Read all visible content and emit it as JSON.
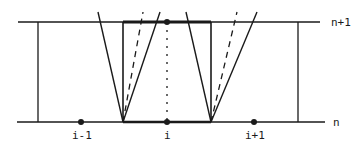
{
  "diagram": {
    "colors": {
      "ink": "#1a1a1a",
      "background": "#ffffff"
    },
    "time_levels": {
      "upper": {
        "label": "n+1",
        "y": 22
      },
      "lower": {
        "label": "n",
        "y": 122
      }
    },
    "grid_points": [
      {
        "label": "i-1",
        "x": 81
      },
      {
        "label": "i",
        "x": 167
      },
      {
        "label": "i+1",
        "x": 254
      }
    ],
    "cell": {
      "left_x": 123,
      "right_x": 211
    },
    "outer_boundaries": {
      "left_x": 38,
      "right_x": 298
    }
  }
}
